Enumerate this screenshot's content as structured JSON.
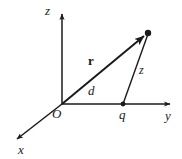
{
  "figure": {
    "background_color": "#ffffff",
    "stroke_color": "#1a1a1a",
    "width": 182,
    "height": 159
  },
  "axes": [
    {
      "id": "z",
      "label": "z",
      "direction": "up",
      "from": [
        62,
        104
      ],
      "to": [
        62,
        10
      ]
    },
    {
      "id": "y",
      "label": "y",
      "direction": "right",
      "from": [
        62,
        104
      ],
      "to": [
        176,
        104
      ]
    },
    {
      "id": "x",
      "label": "x",
      "direction": "down-left",
      "from": [
        62,
        104
      ],
      "to": [
        13,
        143
      ]
    }
  ],
  "points": [
    {
      "id": "origin",
      "label": "O",
      "style": "italic",
      "at": [
        62,
        104
      ],
      "dot": false
    },
    {
      "id": "charge",
      "label": "q",
      "style": "italic",
      "at": [
        123,
        104
      ],
      "dot": true
    },
    {
      "id": "field-point",
      "label": "",
      "style": "none",
      "at": [
        148,
        33
      ],
      "dot": true
    }
  ],
  "segments": [
    {
      "id": "vector-r",
      "label": "r",
      "label_style": "bold",
      "from": [
        62,
        104
      ],
      "to": [
        148,
        33
      ],
      "arrow": true,
      "description": "position vector from origin to field point"
    },
    {
      "id": "distance-d",
      "label": "d",
      "label_style": "italic",
      "from": [
        62,
        104
      ],
      "to": [
        123,
        104
      ],
      "arrow": false,
      "description": "horizontal distance along y from origin to charge"
    },
    {
      "id": "height-z",
      "label": "z",
      "label_style": "italic",
      "from": [
        123,
        104
      ],
      "to": [
        148,
        33
      ],
      "arrow": false,
      "description": "slanted segment from charge q to field point"
    }
  ],
  "labels": {
    "z_axis": "z",
    "y_axis": "y",
    "x_axis": "x",
    "origin": "O",
    "charge": "q",
    "distance": "d",
    "vector": "r",
    "height": "z"
  }
}
